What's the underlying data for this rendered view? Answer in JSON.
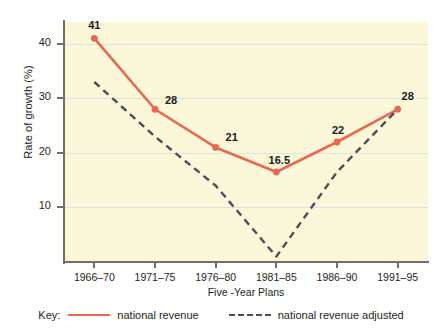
{
  "chart_data": {
    "type": "line",
    "title": "",
    "xlabel": "Five -Year Plans",
    "ylabel": "Rate of growth (%)",
    "categories": [
      "1966–70",
      "1971–75",
      "1976–80",
      "1981–85",
      "1986–90",
      "1991–95"
    ],
    "yticks": [
      10,
      20,
      30,
      40
    ],
    "ylim": [
      0,
      44
    ],
    "grid": true,
    "legend_position": "below",
    "legend_prefix": "Key:",
    "series": [
      {
        "name": "national revenue",
        "style": "solid",
        "color": "#e8694f",
        "markers": true,
        "values": [
          41,
          28,
          21,
          16.5,
          22,
          28
        ],
        "point_labels": [
          "41",
          "28",
          "21",
          "16.5",
          "22",
          "28"
        ]
      },
      {
        "name": "national revenue adjusted",
        "style": "dashed",
        "color": "#4c4a5b",
        "markers": false,
        "values": [
          33,
          23,
          14,
          1,
          16.5,
          28
        ],
        "point_labels": [
          "",
          "",
          "",
          "",
          "",
          ""
        ]
      }
    ],
    "plot_background": "#fbf8da",
    "gridline_color": "#d8e5e2",
    "axis_color": "#6f6f68"
  }
}
